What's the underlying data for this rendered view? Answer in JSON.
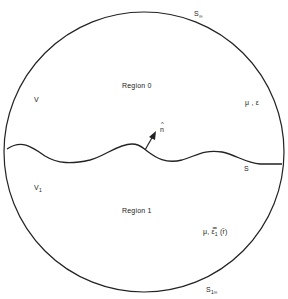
{
  "diagram": {
    "colors": {
      "background": "#ffffff",
      "stroke": "#222222",
      "text": "#222222"
    },
    "labels": {
      "s_infinity": "S",
      "s_infinity_sub": "∞",
      "region_0": "Region 0",
      "v": "V",
      "mu_epsilon": "μ , ε",
      "n_hat_base": "n",
      "n_hat_accent": "^",
      "s_interface": "S",
      "v1": "V",
      "v1_sub": "1",
      "region_1": "Region 1",
      "mu_eps1_r": "μ, ε̿",
      "mu_eps1_r_sub": "1",
      "mu_eps1_r_arg": "(r̄)",
      "s1_infinity": "S",
      "s1_infinity_sub": "1∞"
    },
    "shapes": {
      "outer_circle": {
        "cx": 144,
        "cy": 152,
        "r": 140
      },
      "interface_curve": "wavy interface S dividing region 0 (top) and region 1 (bottom)",
      "normal_arrow": "unit normal n-hat pointing into region 0"
    }
  }
}
